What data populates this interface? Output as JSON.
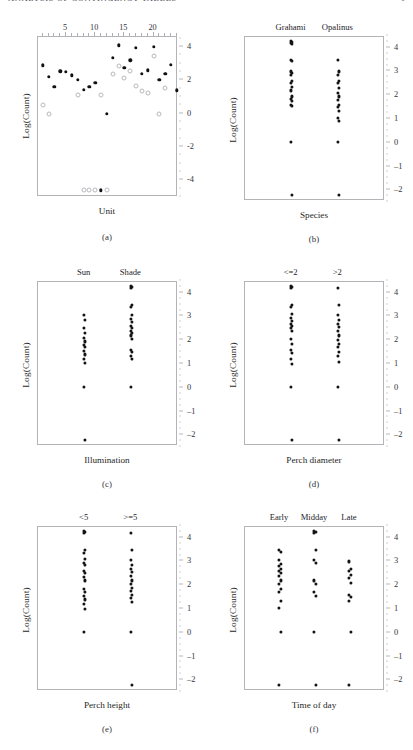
{
  "runhead": {
    "left": "ANALYSIS OF CONTINGENCY TABLES",
    "right": "1"
  },
  "figure": {
    "panels": [
      {
        "id": "a",
        "caption": "(a)",
        "ylabel": "Log(Count)",
        "xaxis_label": "Unit",
        "yticks": [
          4,
          2,
          0,
          -2,
          -4
        ],
        "ylim": [
          -5.0,
          4.6
        ],
        "xticks": [
          5,
          10,
          15,
          20
        ],
        "xlim": [
          0.2,
          24.2
        ],
        "top_labels": []
      },
      {
        "id": "b",
        "caption": "(b)",
        "ylabel": "Log(Count)",
        "xaxis_label": "Species",
        "yticks": [
          4,
          3,
          2,
          1,
          0,
          -1,
          -2
        ],
        "ylim": [
          -2.45,
          4.45
        ],
        "top_labels": [
          "Grahami",
          "Opalinus"
        ]
      },
      {
        "id": "c",
        "caption": "(c)",
        "ylabel": "Log(Count)",
        "xaxis_label": "Illumination",
        "yticks": [
          4,
          3,
          2,
          1,
          0,
          -1,
          -2
        ],
        "ylim": [
          -2.45,
          4.45
        ],
        "top_labels": [
          "Sun",
          "Shade"
        ]
      },
      {
        "id": "d",
        "caption": "(d)",
        "ylabel": "Log(Count)",
        "xaxis_label": "Perch diameter",
        "yticks": [
          4,
          3,
          2,
          1,
          0,
          -1,
          -2
        ],
        "ylim": [
          -2.45,
          4.45
        ],
        "top_labels": [
          "<=2",
          ">2"
        ]
      },
      {
        "id": "e",
        "caption": "(e)",
        "ylabel": "Log(Count)",
        "xaxis_label": "Perch height",
        "yticks": [
          4,
          3,
          2,
          1,
          0,
          -1,
          -2
        ],
        "ylim": [
          -2.45,
          4.45
        ],
        "top_labels": [
          "<5",
          ">=5"
        ]
      },
      {
        "id": "f",
        "caption": "(f)",
        "ylabel": "Log(Count)",
        "xaxis_label": "Time of day",
        "yticks": [
          4,
          3,
          2,
          1,
          0,
          -1,
          -2
        ],
        "ylim": [
          -2.45,
          4.45
        ],
        "top_labels": [
          "Early",
          "Midday",
          "Late"
        ]
      }
    ]
  },
  "chart_data": [
    {
      "type": "scatter",
      "panel": "a",
      "title": "",
      "xlabel": "Unit",
      "ylabel": "Log(Count)",
      "xlim": [
        0.2,
        24.2
      ],
      "ylim": [
        -5.0,
        4.6
      ],
      "xticks": [
        5,
        10,
        15,
        20
      ],
      "yticks": [
        4,
        2,
        0,
        -2,
        -4
      ],
      "grid": false,
      "legend": "none",
      "series": [
        {
          "name": "observed",
          "marker": "filled",
          "points": [
            [
              1,
              2.9
            ],
            [
              2,
              2.2
            ],
            [
              3,
              1.6
            ],
            [
              4,
              2.55
            ],
            [
              5,
              2.5
            ],
            [
              6,
              2.3
            ],
            [
              7,
              2.05
            ],
            [
              8,
              1.45
            ],
            [
              9,
              1.6
            ],
            [
              10,
              1.85
            ],
            [
              11,
              -4.6
            ],
            [
              12,
              0.0
            ],
            [
              13,
              3.35
            ],
            [
              14,
              4.1
            ],
            [
              15,
              2.75
            ],
            [
              16,
              3.2
            ],
            [
              17,
              3.95
            ],
            [
              18,
              2.4
            ],
            [
              19,
              2.6
            ],
            [
              20,
              4.0
            ],
            [
              21,
              2.05
            ],
            [
              22,
              2.4
            ],
            [
              23,
              2.95
            ],
            [
              24,
              1.4
            ]
          ]
        },
        {
          "name": "fitted",
          "marker": "open",
          "points": [
            [
              1,
              0.5
            ],
            [
              2,
              0.0
            ],
            [
              7,
              1.15
            ],
            [
              8,
              -4.6
            ],
            [
              9,
              -4.6
            ],
            [
              10,
              -4.6
            ],
            [
              11,
              1.15
            ],
            [
              12,
              -4.6
            ],
            [
              13,
              2.4
            ],
            [
              14,
              2.85
            ],
            [
              15,
              2.15
            ],
            [
              16,
              2.55
            ],
            [
              17,
              1.65
            ],
            [
              18,
              1.35
            ],
            [
              19,
              1.25
            ],
            [
              20,
              3.45
            ],
            [
              21,
              0.0
            ],
            [
              22,
              1.55
            ]
          ]
        }
      ]
    },
    {
      "type": "scatter",
      "panel": "b",
      "xlabel": "Species",
      "ylabel": "Log(Count)",
      "categories": [
        "Grahami",
        "Opalinus"
      ],
      "ylim": [
        -2.45,
        4.45
      ],
      "yticks": [
        4,
        3,
        2,
        1,
        0,
        -1,
        -2
      ],
      "grid": false,
      "legend": "none",
      "series": [
        {
          "name": "Grahami",
          "values": [
            4.28,
            4.25,
            4.2,
            4.15,
            3.5,
            3.45,
            3.0,
            2.95,
            2.85,
            2.6,
            2.5,
            2.35,
            2.2,
            1.95,
            1.85,
            1.75,
            1.6,
            1.55,
            0.05,
            -2.2
          ]
        },
        {
          "name": "Opalinus",
          "values": [
            3.5,
            3.0,
            2.85,
            2.6,
            2.5,
            2.3,
            2.1,
            1.95,
            1.8,
            1.6,
            1.5,
            1.35,
            1.05,
            0.9,
            0.05,
            -2.2
          ]
        }
      ]
    },
    {
      "type": "scatter",
      "panel": "c",
      "xlabel": "Illumination",
      "ylabel": "Log(Count)",
      "categories": [
        "Sun",
        "Shade"
      ],
      "ylim": [
        -2.45,
        4.45
      ],
      "yticks": [
        4,
        3,
        2,
        1,
        0,
        -1,
        -2
      ],
      "grid": false,
      "legend": "none",
      "series": [
        {
          "name": "Sun",
          "values": [
            3.05,
            2.85,
            2.5,
            2.3,
            2.1,
            1.95,
            1.8,
            1.7,
            1.55,
            1.4,
            1.2,
            1.05,
            0.05,
            -2.2
          ]
        },
        {
          "name": "Shade",
          "values": [
            4.3,
            4.25,
            4.2,
            3.5,
            3.4,
            3.05,
            2.9,
            2.75,
            2.6,
            2.5,
            2.4,
            2.3,
            2.2,
            2.05,
            1.6,
            1.5,
            1.35,
            1.2,
            0.05
          ]
        }
      ]
    },
    {
      "type": "scatter",
      "panel": "d",
      "xlabel": "Perch diameter",
      "ylabel": "Log(Count)",
      "categories": [
        "<=2",
        ">2"
      ],
      "ylim": [
        -2.45,
        4.45
      ],
      "yticks": [
        4,
        3,
        2,
        1,
        0,
        -1,
        -2
      ],
      "grid": false,
      "legend": "none",
      "series": [
        {
          "name": "<=2",
          "values": [
            4.3,
            4.25,
            4.2,
            3.5,
            3.4,
            3.1,
            2.95,
            2.8,
            2.7,
            2.6,
            2.5,
            2.4,
            2.05,
            1.85,
            1.6,
            1.45,
            1.2,
            1.0,
            0.05,
            -2.2
          ]
        },
        {
          "name": ">2",
          "values": [
            4.2,
            3.5,
            3.05,
            2.85,
            2.7,
            2.55,
            2.4,
            2.2,
            2.0,
            1.85,
            1.7,
            1.5,
            1.35,
            1.1,
            0.05,
            -2.2
          ]
        }
      ]
    },
    {
      "type": "scatter",
      "panel": "e",
      "xlabel": "Perch height",
      "ylabel": "Log(Count)",
      "categories": [
        "<5",
        ">=5"
      ],
      "ylim": [
        -2.45,
        4.45
      ],
      "yticks": [
        4,
        3,
        2,
        1,
        0,
        -1,
        -2
      ],
      "grid": false,
      "legend": "none",
      "series": [
        {
          "name": "<5",
          "values": [
            4.3,
            4.25,
            4.2,
            3.5,
            3.35,
            3.1,
            2.95,
            2.85,
            2.6,
            2.5,
            2.35,
            2.2,
            1.85,
            1.7,
            1.55,
            1.4,
            1.2,
            1.0,
            0.05
          ]
        },
        {
          "name": ">=5",
          "values": [
            4.2,
            3.5,
            3.05,
            2.85,
            2.7,
            2.55,
            2.4,
            2.2,
            2.05,
            1.9,
            1.75,
            1.6,
            1.45,
            1.3,
            0.05,
            -2.2
          ]
        }
      ]
    },
    {
      "type": "scatter",
      "panel": "f",
      "xlabel": "Time of day",
      "ylabel": "Log(Count)",
      "categories": [
        "Early",
        "Midday",
        "Late"
      ],
      "ylim": [
        -2.45,
        4.45
      ],
      "yticks": [
        4,
        3,
        2,
        1,
        0,
        -1,
        -2
      ],
      "grid": false,
      "legend": "none",
      "series": [
        {
          "name": "Early",
          "values": [
            3.5,
            3.4,
            3.05,
            2.9,
            2.8,
            2.7,
            2.6,
            2.5,
            2.4,
            2.2,
            2.05,
            1.85,
            1.7,
            1.35,
            1.05,
            0.05,
            -2.2
          ]
        },
        {
          "name": "Midday",
          "values": [
            4.3,
            4.25,
            4.2,
            3.5,
            3.05,
            2.95,
            2.2,
            2.05,
            1.7,
            1.55,
            0.05,
            -2.2
          ]
        },
        {
          "name": "Late",
          "values": [
            3.0,
            2.7,
            2.6,
            2.45,
            2.3,
            2.1,
            1.6,
            1.5,
            1.35,
            0.05,
            -2.2
          ]
        }
      ]
    }
  ]
}
